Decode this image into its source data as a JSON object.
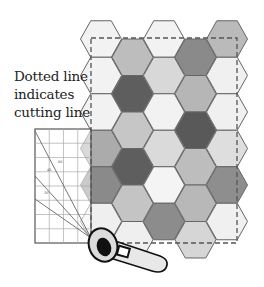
{
  "annotation": {
    "lines": [
      "Dotted line",
      "indicates",
      "cutting line"
    ]
  },
  "hex_grid": {
    "origin_x": 101,
    "origin_y": 39,
    "radius": 20.5,
    "col_step": 31.5,
    "row_step": 36.5,
    "stroke": "#666666",
    "columns": [
      {
        "col": 0,
        "offset": 0,
        "colors": [
          "#f2f2f2",
          "#f2f2f2",
          "#f2f2f2",
          "#ababab",
          "#8a8a8a",
          "#efefef"
        ]
      },
      {
        "col": 1,
        "offset": 1,
        "colors": [
          "#bdbdbd",
          "#5e5e5e",
          "#c6c6c6",
          "#5e5e5e",
          "#c4c4c4",
          "#efefef"
        ]
      },
      {
        "col": 2,
        "offset": 0,
        "colors": [
          "#f2f2f2",
          "#d8d8d8",
          "#f2f2f2",
          "#dadada",
          "#f4f4f4",
          "#8c8c8c"
        ]
      },
      {
        "col": 3,
        "offset": 1,
        "colors": [
          "#8a8a8a",
          "#b6b6b6",
          "#595959",
          "#bdbdbd",
          "#b8b8b8",
          "#d6d6d6"
        ]
      },
      {
        "col": 4,
        "offset": 0,
        "colors": [
          "#bababa",
          "#f0f0f0",
          "#f0f0f0",
          "#dedede",
          "#8e8e8e",
          "#f0f0f0"
        ]
      }
    ]
  },
  "cutting_line": {
    "x": 91,
    "y": 38,
    "width": 146,
    "height": 205,
    "color": "#555555"
  },
  "ruler": {
    "x": 35,
    "y": 129,
    "width": 56,
    "height": 114,
    "cell": 14.25,
    "angle_labels": [
      "60",
      "45",
      "30"
    ]
  },
  "rotary_cutter": {
    "blade_color": "#111111",
    "body_color": "#e6e6e6"
  }
}
